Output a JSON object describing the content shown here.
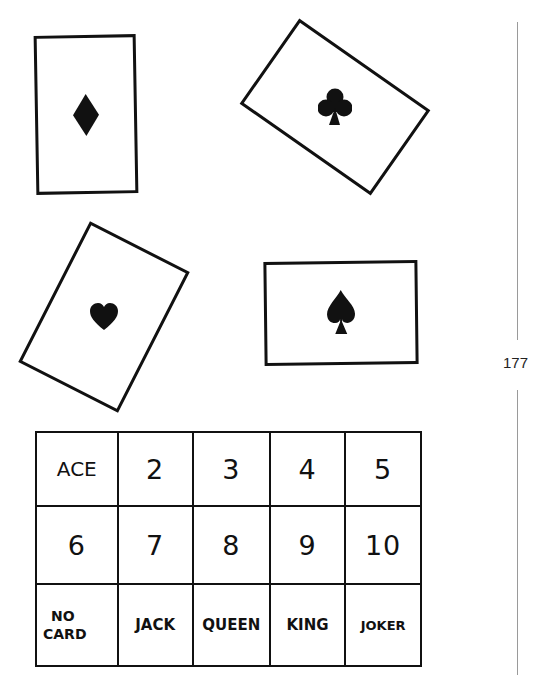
{
  "page": {
    "page_number": "177"
  },
  "cards": [
    {
      "suit": "diamond",
      "symbol": "♦"
    },
    {
      "suit": "club",
      "symbol": "♣"
    },
    {
      "suit": "heart",
      "symbol": "♥"
    },
    {
      "suit": "spade",
      "symbol": "♠"
    }
  ],
  "grid": {
    "rows": [
      [
        "ACE",
        "2",
        "3",
        "4",
        "5"
      ],
      [
        "6",
        "7",
        "8",
        "9",
        "10"
      ],
      [
        "NO\nCARD",
        "JACK",
        "QUEEN",
        "KING",
        "JOKER"
      ]
    ],
    "no_card_line1": "NO",
    "no_card_line2": "CARD"
  }
}
